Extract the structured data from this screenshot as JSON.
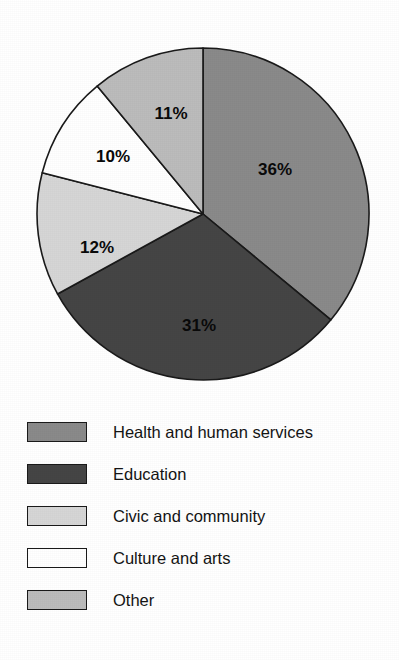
{
  "chart_data": {
    "type": "pie",
    "title": "",
    "subtitle": "",
    "xlabel": "",
    "ylabel": "",
    "grid": false,
    "legend_position": "bottom-left",
    "start_angle_deg": 0,
    "direction": "clockwise",
    "categories": [
      "Health and human services",
      "Education",
      "Civic and community",
      "Culture and arts",
      "Other"
    ],
    "values": [
      36,
      31,
      12,
      10,
      11
    ],
    "value_unit": "%",
    "data_labels": [
      "36%",
      "31%",
      "12%",
      "10%",
      "11%"
    ],
    "colors": [
      "#8a8a8a",
      "#454545",
      "#d6d6d6",
      "#ffffff",
      "#bcbcbc"
    ],
    "stroke_color": "#1a1a1a",
    "slices": [
      {
        "label": "Health and human services",
        "value": 36,
        "data_label": "36%",
        "color": "#8a8a8a",
        "start_deg": 0,
        "end_deg": 129.6,
        "label_x": 275,
        "label_y": 171
      },
      {
        "label": "Education",
        "value": 31,
        "data_label": "31%",
        "color": "#454545",
        "start_deg": 129.6,
        "end_deg": 241.2,
        "label_x": 199,
        "label_y": 327
      },
      {
        "label": "Civic and community",
        "value": 12,
        "data_label": "12%",
        "color": "#d6d6d6",
        "start_deg": 241.2,
        "end_deg": 284.4,
        "label_x": 97,
        "label_y": 249
      },
      {
        "label": "Culture and arts",
        "value": 10,
        "data_label": "10%",
        "color": "#ffffff",
        "start_deg": 284.4,
        "end_deg": 320.4,
        "label_x": 113,
        "label_y": 158
      },
      {
        "label": "Other",
        "value": 11,
        "data_label": "11%",
        "color": "#bcbcbc",
        "start_deg": 320.4,
        "end_deg": 360,
        "label_x": 171,
        "label_y": 115
      }
    ],
    "geometry": {
      "center_x": 203,
      "center_y": 214,
      "radius": 166
    }
  },
  "legend": {
    "items": [
      {
        "label": "Health and human services",
        "color": "#8a8a8a",
        "top": 8
      },
      {
        "label": "Education",
        "color": "#454545",
        "top": 50
      },
      {
        "label": "Civic and community",
        "color": "#d6d6d6",
        "top": 92
      },
      {
        "label": "Culture and arts",
        "color": "#ffffff",
        "top": 134
      },
      {
        "label": "Other",
        "color": "#bcbcbc",
        "top": 176
      }
    ]
  }
}
